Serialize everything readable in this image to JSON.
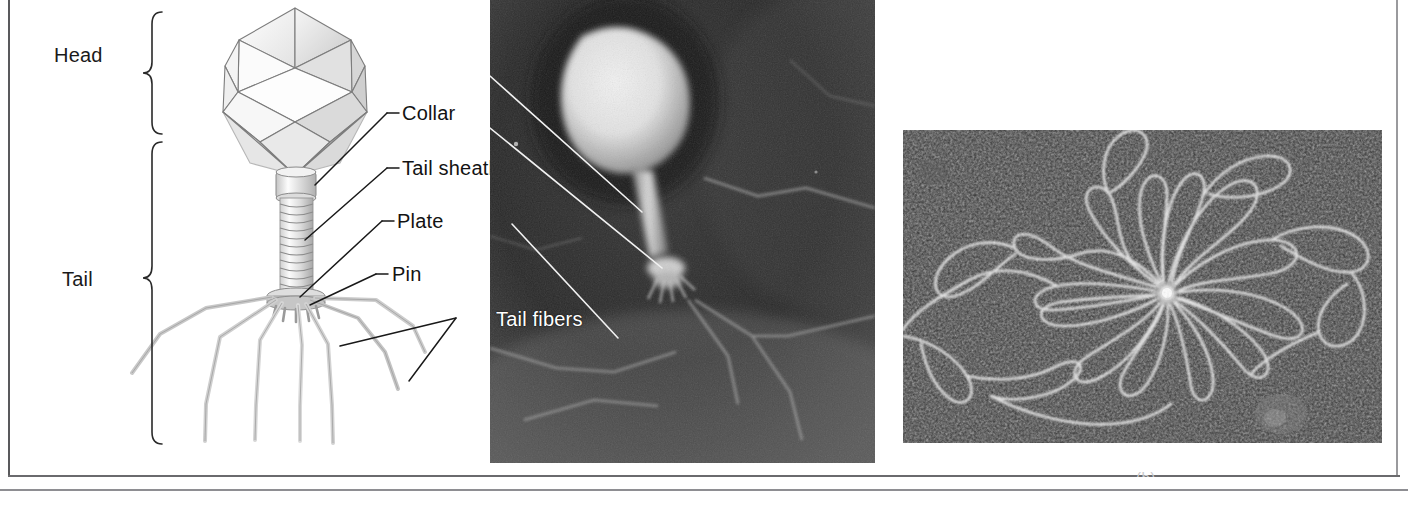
{
  "figure": {
    "caption_fragment": "(b)"
  },
  "diagram": {
    "braces": [
      {
        "label": "Head",
        "name": "head"
      },
      {
        "label": "Tail",
        "name": "tail"
      }
    ],
    "callouts": [
      {
        "label": "Collar",
        "name": "collar"
      },
      {
        "label": "Tail sheath",
        "name": "tail-sheath"
      },
      {
        "label": "Plate",
        "name": "plate"
      },
      {
        "label": "Pin",
        "name": "pin"
      },
      {
        "label": "Tail fibers",
        "name": "tail-fibers"
      }
    ]
  },
  "panels": {
    "diagram_alt": "Labeled line drawing of a bacteriophage with icosahedral head, collar, striated tail sheath, base plate, pins and tail fibers",
    "micrograph_phage_alt": "Electron micrograph of a single bacteriophage particle showing bright head and tail",
    "micrograph_dna_alt": "Electron micrograph of a released phage DNA molecule spread in loops around a central core"
  },
  "colors": {
    "ink": "#131313",
    "brace": "#232323",
    "frame": "#59595c",
    "photo_dark": "#2b2b2b",
    "photo_light": "#f2f2f2",
    "label_on_photo": "#ffffff"
  }
}
